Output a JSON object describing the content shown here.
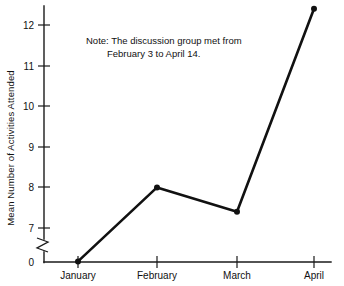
{
  "chart_data": {
    "type": "line",
    "title": "",
    "xlabel": "",
    "ylabel": "Mean Number of Activities Attended",
    "categories": [
      "January",
      "February",
      "March",
      "April"
    ],
    "values": [
      0.4,
      8.0,
      7.4,
      12.4
    ],
    "series": [
      {
        "name": "Mean Number of Activities Attended",
        "values": [
          0.4,
          8.0,
          7.4,
          12.4
        ]
      }
    ],
    "ylim": [
      0,
      12.6
    ],
    "y_ticks": [
      0,
      7,
      8,
      9,
      10,
      11,
      12
    ],
    "y_tick_labels": [
      "0",
      "7",
      "8",
      "9",
      "10",
      "11",
      "12"
    ],
    "axis_break": {
      "present": true,
      "between": [
        0,
        7
      ],
      "style": "zigzag"
    },
    "grid": false,
    "legend": false,
    "legend_position": "none",
    "markers": true,
    "annotations": [
      {
        "name": "note",
        "lines": [
          "Note: The discussion group met from",
          "February 3 to April 14."
        ]
      }
    ]
  },
  "note": {
    "line1": "Note: The discussion group met from",
    "line2": "February 3 to April 14."
  },
  "axes": {
    "y_title": "Mean Number of Activities Attended",
    "y_labels": {
      "t12": "12",
      "t11": "11",
      "t10": "10",
      "t9": "9",
      "t8": "8",
      "t7": "7",
      "t0": "0"
    },
    "x_labels": {
      "c0": "January",
      "c1": "February",
      "c2": "March",
      "c3": "April"
    }
  },
  "colors": {
    "background": "#ffffff",
    "ink": "#111111",
    "axis": "#1a1a1a",
    "series": "#111111"
  }
}
